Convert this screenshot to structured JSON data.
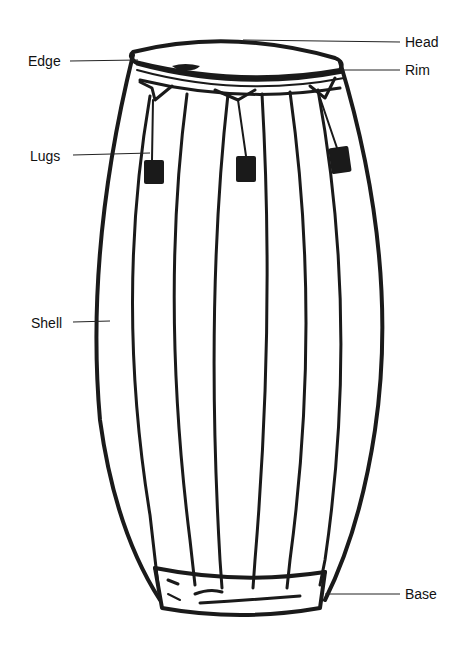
{
  "diagram": {
    "labels": {
      "head": "Head",
      "edge": "Edge",
      "rim": "Rim",
      "lugs": "Lugs",
      "shell": "Shell",
      "base": "Base"
    },
    "colors": {
      "ink": "#1a1a1a",
      "background": "#ffffff"
    }
  }
}
